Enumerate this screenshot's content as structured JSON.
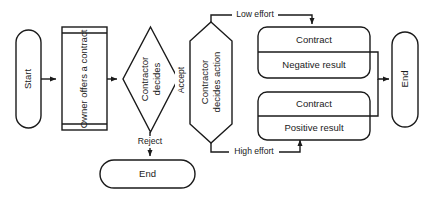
{
  "diagram": {
    "colors": {
      "stroke": "#1a1a1a",
      "fill": "#ffffff",
      "background": "#ffffff"
    },
    "nodes": {
      "start": {
        "label": "Start",
        "shape": "terminator-vertical"
      },
      "owner_offers": {
        "label": "Owner offers a contract",
        "shape": "predefined-process-vertical"
      },
      "contractor_decides": {
        "label_line1": "Contractor",
        "label_line2": "decides",
        "shape": "decision-diamond"
      },
      "contractor_action": {
        "label_line1": "Contractor",
        "label_line2": "decides action",
        "shape": "preparation-hexagon"
      },
      "negative": {
        "title": "Contract",
        "result": "Negative result",
        "shape": "rounded-rect-split"
      },
      "positive": {
        "title": "Contract",
        "result": "Positive result",
        "shape": "rounded-rect-split"
      },
      "end_right": {
        "label": "End",
        "shape": "terminator-vertical"
      },
      "end_bottom": {
        "label": "End",
        "shape": "terminator-horizontal"
      }
    },
    "edges": {
      "accept": "Accept",
      "reject": "Reject",
      "low_effort": "Low effort",
      "high_effort": "High effort"
    }
  }
}
